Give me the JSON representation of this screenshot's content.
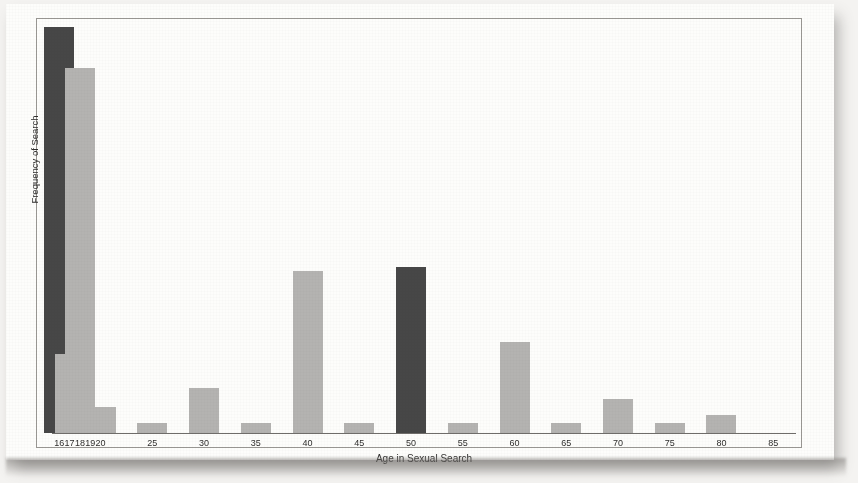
{
  "chart_data": {
    "type": "bar",
    "title": "",
    "xlabel": "Age in Sexual Search",
    "ylabel": "Frequency of Search",
    "tick_labels": [
      "16",
      "17",
      "18",
      "19",
      "20",
      "25",
      "30",
      "35",
      "40",
      "45",
      "50",
      "55",
      "60",
      "65",
      "70",
      "75",
      "80",
      "85"
    ],
    "categories": [
      16,
      17,
      18,
      19,
      20,
      25,
      30,
      35,
      40,
      45,
      50,
      55,
      60,
      65,
      70,
      75,
      80,
      85
    ],
    "values": [
      100,
      19.5,
      90,
      6.5,
      6.5,
      2.5,
      11,
      2.5,
      40,
      2.5,
      41,
      2.5,
      22.5,
      2.5,
      8.5,
      2.5,
      4.5,
      0
    ],
    "bar_colors": [
      "dark",
      "light",
      "light",
      "light",
      "light",
      "light",
      "light",
      "light",
      "light",
      "light",
      "dark",
      "light",
      "light",
      "light",
      "light",
      "light",
      "light",
      "light"
    ],
    "ylim": [
      0,
      100
    ],
    "grid": false,
    "legend": "none",
    "axis_ticks_y": "none",
    "colors": {
      "dark_bar": "#474747",
      "light_bar": "#b4b3b1",
      "axis": "#6f6d6a",
      "text": "#2e2d2c",
      "paper": "#fdfdfb",
      "background": "#f4f3f1"
    }
  }
}
